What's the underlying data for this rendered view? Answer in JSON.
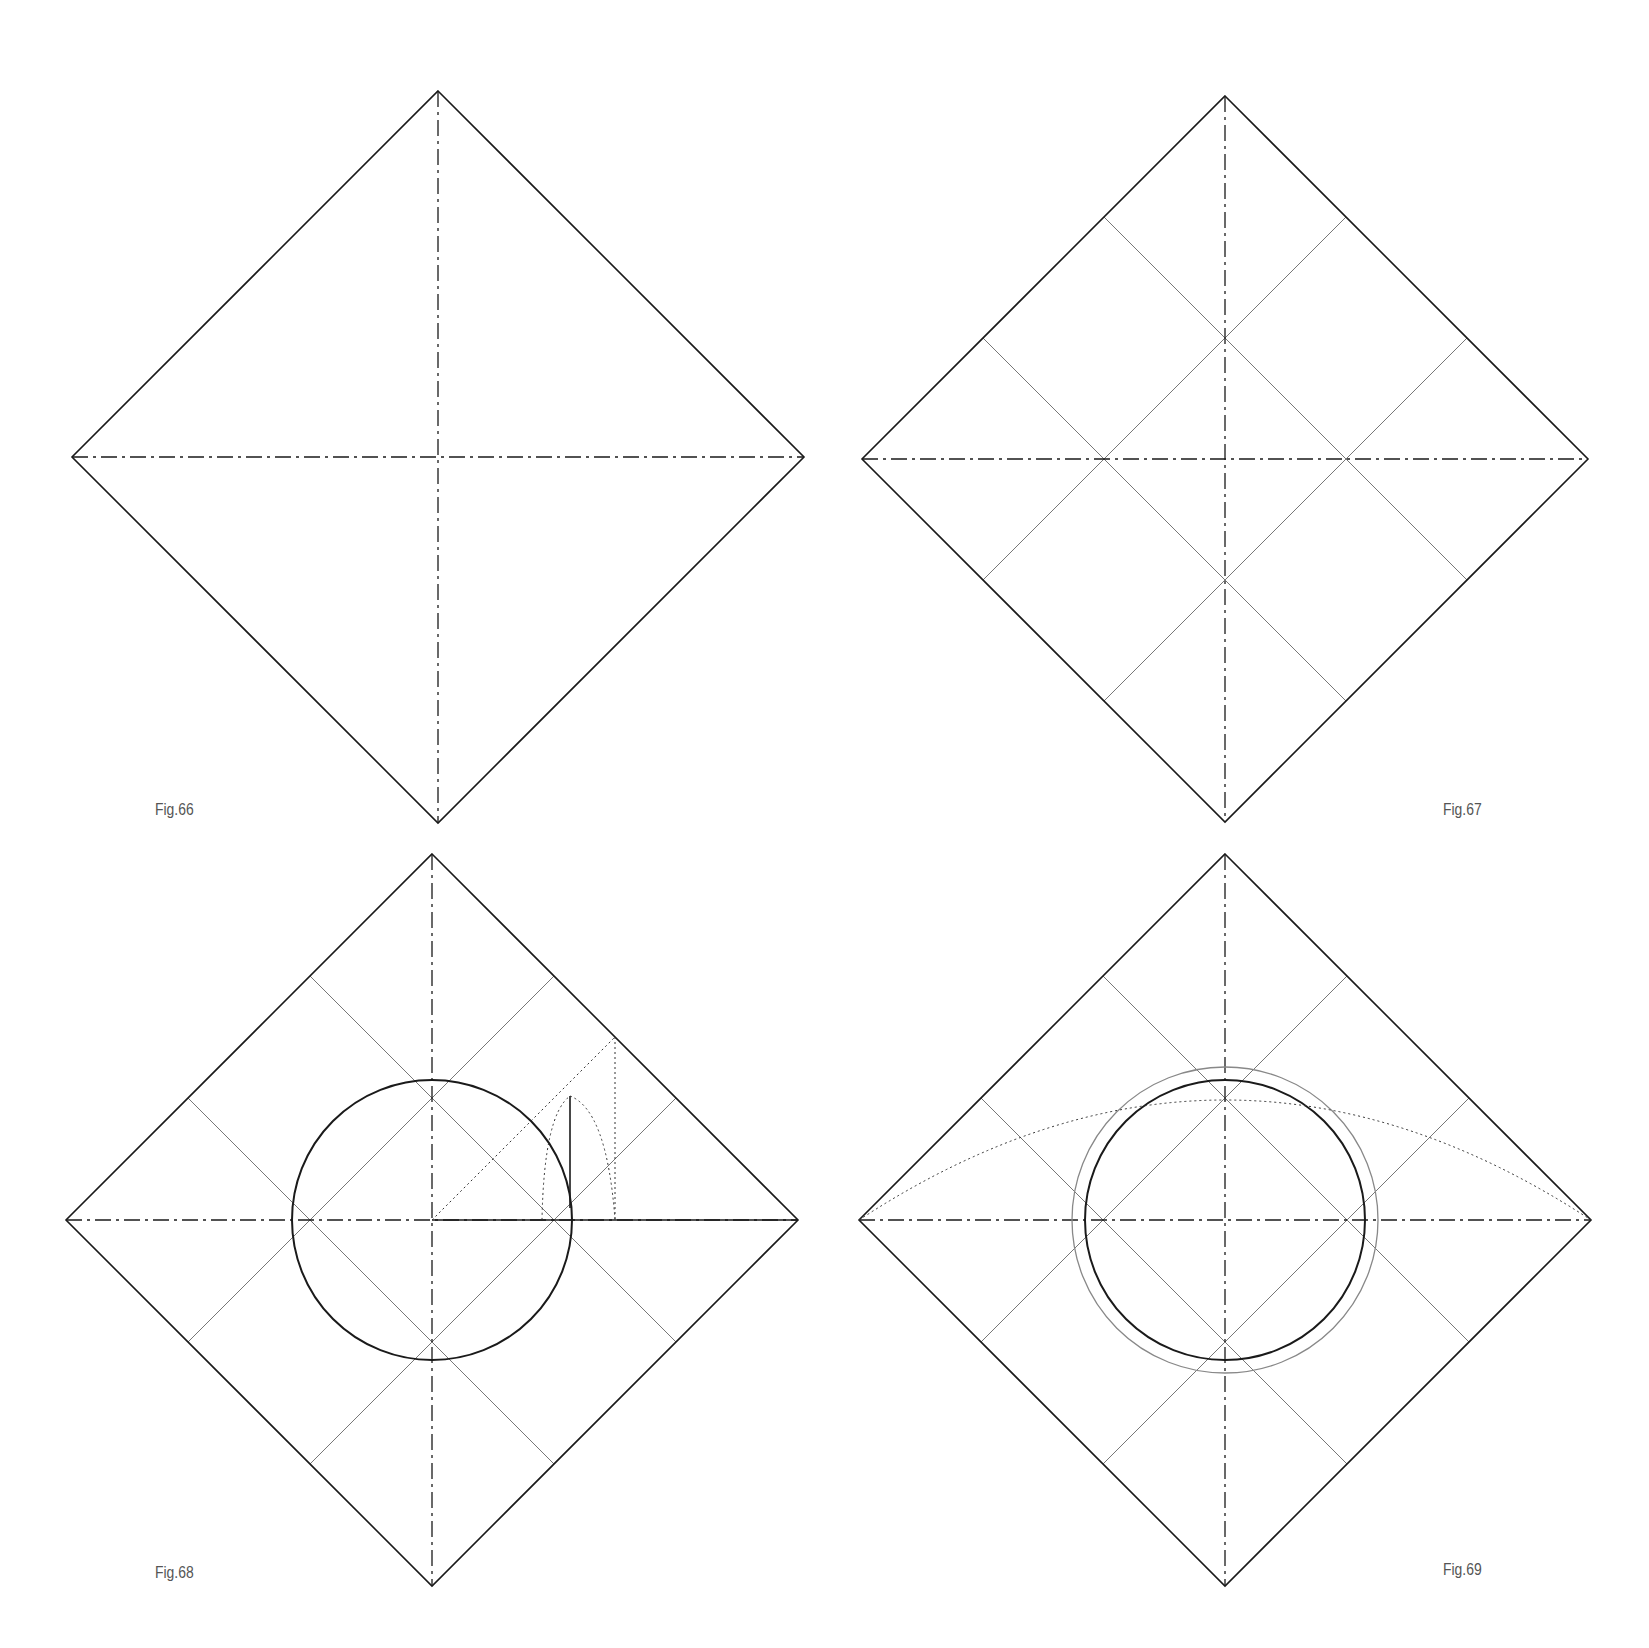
{
  "figures": [
    {
      "id": "fig66",
      "label": "Fig.66",
      "center": [
        438,
        457
      ],
      "half": 366,
      "grid": false,
      "label_pos": [
        155,
        800
      ]
    },
    {
      "id": "fig67",
      "label": "Fig.67",
      "center": [
        1225,
        459
      ],
      "half": 363,
      "grid": true,
      "label_pos": [
        1443,
        800
      ]
    },
    {
      "id": "fig68",
      "label": "Fig.68",
      "center": [
        432,
        1220
      ],
      "half": 366,
      "grid": true,
      "circle_r": 140,
      "label_pos": [
        155,
        1563
      ]
    },
    {
      "id": "fig69",
      "label": "Fig.69",
      "center": [
        1225,
        1220
      ],
      "half": 366,
      "grid": true,
      "circle_r": 140,
      "outer_r": 153,
      "label_pos": [
        1443,
        1560
      ]
    }
  ],
  "colors": {
    "line": "#1a1a1a",
    "grid": "#777777",
    "background": "#ffffff"
  }
}
